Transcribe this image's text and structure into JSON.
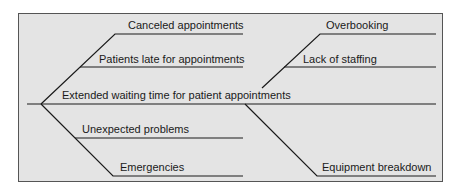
{
  "diagram": {
    "type": "fishbone",
    "effect": "Extended waiting time for patient appointments",
    "causes": {
      "upper_left": [
        "Canceled appointments",
        "Patients late for appointments"
      ],
      "upper_right": [
        "Overbooking",
        "Lack of staffing"
      ],
      "lower_left": [
        "Unexpected problems",
        "Emergencies"
      ],
      "lower_right": [
        "Equipment breakdown"
      ]
    }
  }
}
